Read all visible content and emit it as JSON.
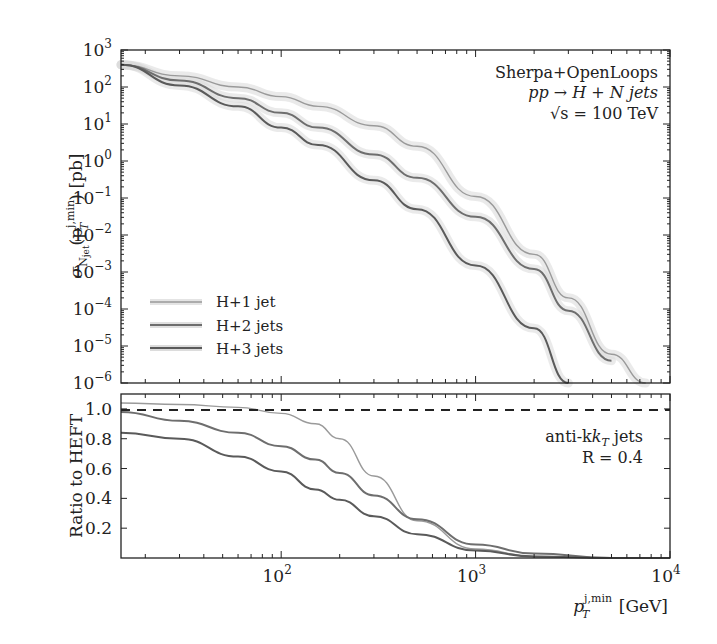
{
  "chart_data": [
    {
      "panel": "main",
      "type": "line",
      "title": "",
      "xlabel": "p_T^{j,min} [GeV]",
      "ylabel": "σ_{N_jet}(p_T^{j,min}) [pb]",
      "xscale": "log",
      "yscale": "log",
      "xlim": [
        15,
        10000
      ],
      "ylim": [
        1e-06,
        1000
      ],
      "x_ticks": [
        "10^2",
        "10^3",
        "10^4"
      ],
      "y_ticks": [
        "10^3",
        "10^2",
        "10^1",
        "10^0",
        "10^-1",
        "10^-2",
        "10^-3",
        "10^-4",
        "10^-5",
        "10^-6"
      ],
      "annotations": [
        "Sherpa+OpenLoops",
        "pp → H + N jets",
        "√s = 100 TeV"
      ],
      "legend_position": "lower left",
      "grid": false,
      "x": [
        15,
        30,
        60,
        100,
        155,
        300,
        500,
        1000,
        2000,
        3000,
        5000,
        7500
      ],
      "series": [
        {
          "name": "H+1 jet",
          "values": [
            400,
            200,
            100,
            55,
            30,
            9,
            2.5,
            0.11,
            0.003,
            0.0002,
            6e-06,
            1e-06
          ]
        },
        {
          "name": "H+2 jets",
          "values": [
            400,
            150,
            50,
            20,
            8,
            1.5,
            0.35,
            0.031,
            0.0012,
            9e-05,
            4e-06,
            null
          ]
        },
        {
          "name": "H+3 jets",
          "values": [
            400,
            110,
            30,
            8,
            2.7,
            0.3,
            0.05,
            0.0015,
            3e-05,
            1e-06,
            null,
            null
          ]
        }
      ]
    },
    {
      "panel": "ratio",
      "type": "line",
      "xlabel": "p_T^{j,min} [GeV]",
      "ylabel": "Ratio to HEFT",
      "xscale": "log",
      "xlim": [
        15,
        10000
      ],
      "ylim": [
        0,
        1.1
      ],
      "y_ticks": [
        "1.0",
        "0.8",
        "0.6",
        "0.4",
        "0.2"
      ],
      "reference_line": {
        "y": 1.0,
        "style": "dashed"
      },
      "annotations": [
        "anti-k_T jets",
        "R = 0.4"
      ],
      "x": [
        15,
        30,
        60,
        100,
        150,
        200,
        300,
        500,
        1000,
        2000,
        5000,
        10000
      ],
      "series": [
        {
          "name": "H+1 jet",
          "values": [
            1.04,
            1.03,
            1.01,
            0.97,
            0.9,
            0.8,
            0.55,
            0.25,
            0.06,
            0.01,
            0.0,
            0.0
          ]
        },
        {
          "name": "H+2 jets",
          "values": [
            0.98,
            0.92,
            0.84,
            0.75,
            0.66,
            0.57,
            0.42,
            0.26,
            0.09,
            0.03,
            0.0,
            0.0
          ]
        },
        {
          "name": "H+3 jets",
          "values": [
            0.84,
            0.8,
            0.68,
            0.58,
            0.46,
            0.39,
            0.28,
            0.16,
            0.05,
            0.01,
            0.0,
            0.0
          ]
        }
      ]
    }
  ],
  "labels": {
    "ylabel_main": "σ",
    "ylabel_main_rest": "(p",
    "ylabel_main_unit": ") [pb]",
    "ylabel_ratio": "Ratio to HEFT",
    "xlabel_p": "p",
    "xlabel_sup": "j,min",
    "xlabel_sub": "T",
    "xlabel_unit": " [GeV]",
    "ann_line1": "Sherpa+OpenLoops",
    "ann_line2": "pp → H + N jets",
    "ann_line3": "√s = 100 TeV",
    "ann_ratio1": "anti-k",
    "ann_ratio1_sub": "T",
    "ann_ratio1_rest": " jets",
    "ann_ratio2": "R = 0.4",
    "legend": [
      "H+1 jet",
      "H+2 jets",
      "H+3 jets"
    ],
    "x_ticks": [
      "10",
      "10",
      "10"
    ],
    "x_tick_exps": [
      "2",
      "3",
      "4"
    ],
    "y_tick_exps": [
      "3",
      "2",
      "1",
      "0",
      "−1",
      "−2",
      "−3",
      "−4",
      "−5",
      "−6"
    ],
    "ratio_ticks": [
      "1.0",
      "0.8",
      "0.6",
      "0.4",
      "0.2"
    ]
  },
  "colors": {
    "h1": "#9a9a9a",
    "h2": "#6e6e6e",
    "h3": "#5a5a5a",
    "band": "#d8d8d8",
    "axis": "#222222"
  }
}
